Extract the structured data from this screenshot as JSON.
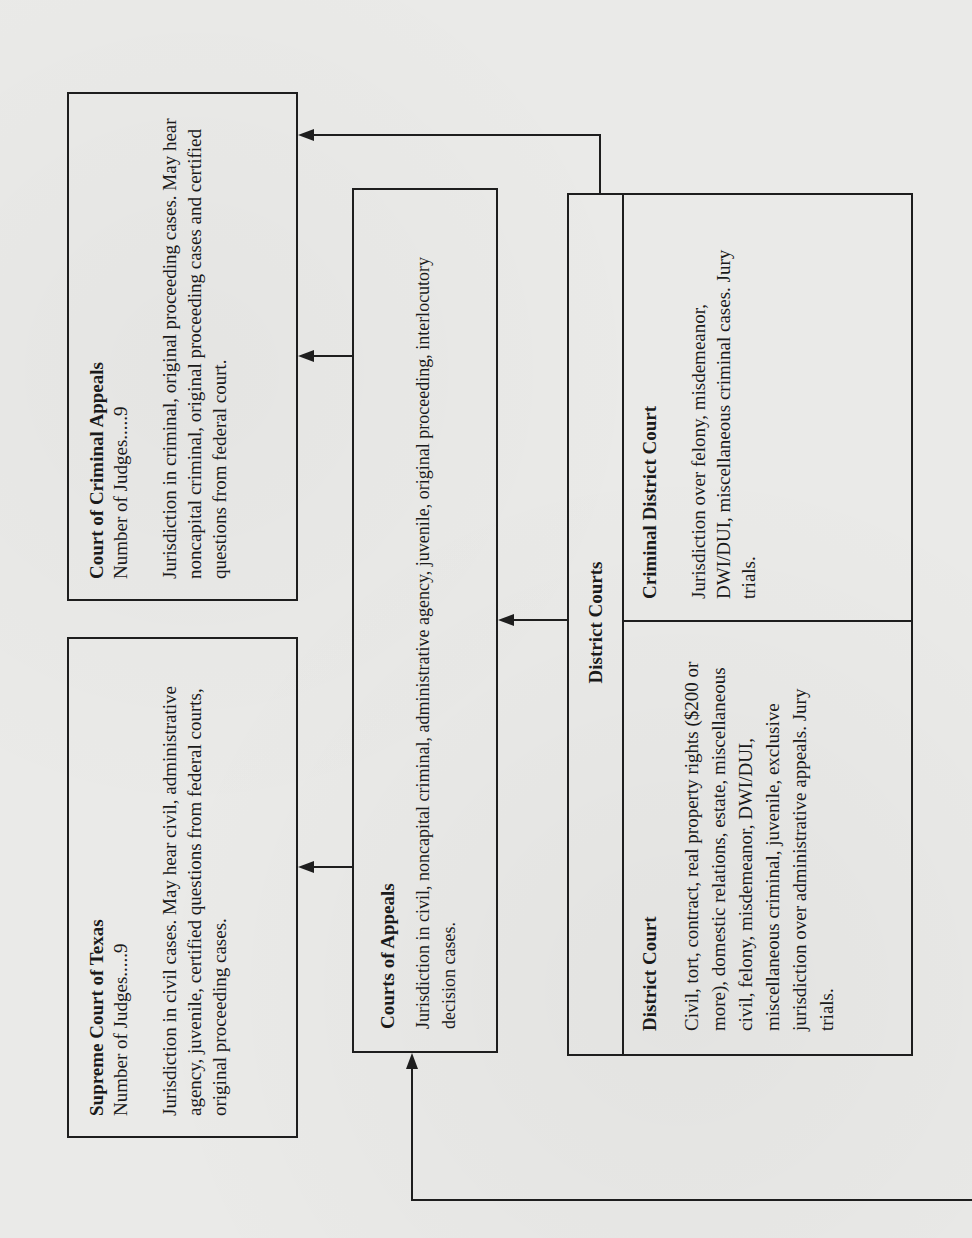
{
  "diagram": {
    "orientation": "rotated 90 degrees counter-clockwise",
    "court_of_criminal_appeals": {
      "title": "Court of Criminal Appeals",
      "judges": "Number of Judges.....9",
      "description": "Jurisdiction in criminal, original proceeding cases. May hear noncapital criminal, original proceeding cases and certified questions from federal court."
    },
    "supreme_court": {
      "title": "Supreme Court of Texas",
      "judges": "Number of Judges.....9",
      "description": "Jurisdiction in civil cases. May hear civil, administrative agency, juvenile, certified questions from federal courts, original proceeding cases."
    },
    "courts_of_appeals": {
      "title": "Courts of Appeals",
      "description": "Jurisdiction in civil, noncapital criminal, administrative agency, juvenile, original proceeding, interlocutory decision cases."
    },
    "district_courts": {
      "header": "District Courts",
      "district_court": {
        "title": "District Court",
        "description": "Civil, tort, contract, real property rights ($200 or more), domestic relations, estate, miscellaneous civil, felony, misdemeanor, DWI/DUI, miscellaneous criminal, juvenile, exclusive jurisdiction over administrative appeals. Jury trials."
      },
      "criminal_district_court": {
        "title": "Criminal District Court",
        "description": "Jurisdiction over felony, misdemeanor, DWI/DUI, miscellaneous criminal cases. Jury trials."
      }
    },
    "connections": [
      {
        "from": "Courts of Appeals",
        "to": "Court of Criminal Appeals"
      },
      {
        "from": "Courts of Appeals",
        "to": "Supreme Court of Texas"
      },
      {
        "from": "District Courts",
        "to": "Courts of Appeals"
      },
      {
        "from": "District Courts",
        "to": "Court of Criminal Appeals"
      },
      {
        "from": "off-page lower court",
        "to": "Courts of Appeals"
      }
    ]
  }
}
